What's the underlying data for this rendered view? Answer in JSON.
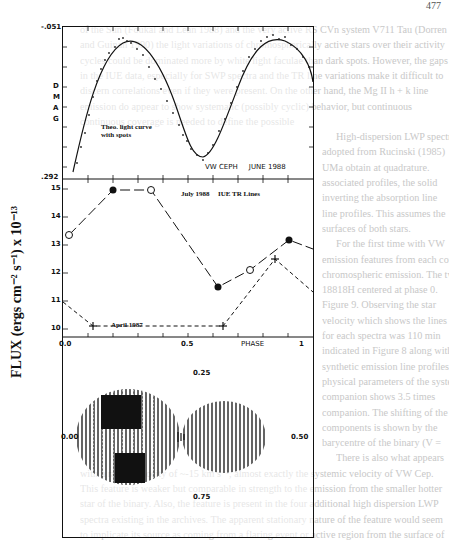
{
  "page": {
    "page_number": "477",
    "body_text_lines": [
      "of the Sun (Foukal and Lean 1988) and the very active RS CVn system V711 Tau (Dorren",
      "and Guinan 1990) the light variations of chromospherically active stars over their activity",
      "cycles could be dominated more by white light faculae than dark spots. However, the gaps",
      "in the IUE data, especially for SWP spectra and the TR line variations make it difficult to",
      "discern correlations even if they were present. On the other hand, the Mg II h + k line",
      "emission do appear to show systematic (possibly cyclic) behavior, but continuous",
      "continuous coverage is needed to define the possible",
      "High-dispersion LWP spectra",
      "adopted from Rucinski (1985)",
      "UMa obtain at quadrature.",
      "associated profiles, the solid",
      "inverting the absorption line",
      "line profiles. This assumes the",
      "surfaces of both stars.",
      "For the first time with VW",
      "emission features from each component",
      "chromospheric emission. The two highest",
      "18818H centered at phase 0.",
      "Figure 9. Observing the star",
      "velocity which shows the lines",
      "for each spectra was 110 min",
      "indicated in Figure 8 along with",
      "synthetic emission line profiles",
      "physical parameters of the system",
      "companion shows 3.5 times",
      "companion. The shifting of the",
      "components is shown by the",
      "barycentre of the binary (V =",
      "There is also what appears",
      "with a radial velocity of ~-15 km s⁻¹, almost exactly the systemic velocity of VW Cep.",
      "This feature is weaker but comparable in strength to the emission from the smaller hotter",
      "star of the binary. Also, the feature is present in the four additional high dispersion LWP",
      "spectra existing in the archives. The apparent stationary nature of the feature would seem",
      "to implicate its source as coming from a flaring event or active region from the surface of"
    ]
  },
  "figure": {
    "ylabel": "FLUX (ergs cm⁻² s⁻¹) x 10⁻¹³",
    "top_panel": {
      "y_top_label": "-.051",
      "y_bottom_label": ".292",
      "axis_label_vertical": [
        "D",
        "M",
        "A",
        "G"
      ],
      "curve_label_1": "Theo. light curve",
      "curve_label_2": "with spots",
      "annotation": "VW CEPH     JUNE 1988"
    },
    "middle_panel": {
      "title": "IUE TR Lines",
      "series_label_1": "July 1988",
      "series_label_2": "April 1987",
      "y_ticks": [
        "15",
        "14",
        "13",
        "12",
        "11",
        "10"
      ],
      "x_ticks": [
        "0.0",
        "0.5",
        "1"
      ],
      "x_label": "PHASE"
    },
    "bottom_panel": {
      "phase_labels": {
        "top": "0.25",
        "left": "0.00",
        "right": "0.50",
        "bottom": "0.75"
      }
    }
  },
  "chart_data": [
    {
      "type": "scatter",
      "title": "VW CEPH JUNE 1988",
      "xlabel": "PHASE",
      "ylabel": "DMAG",
      "ylim": [
        0.292,
        -0.051
      ],
      "xlim": [
        0.0,
        1.0
      ],
      "series": [
        {
          "name": "Theo. light curve with spots",
          "type": "line",
          "x": [
            0.0,
            0.05,
            0.1,
            0.15,
            0.2,
            0.25,
            0.3,
            0.35,
            0.4,
            0.45,
            0.5,
            0.55,
            0.6,
            0.65,
            0.7,
            0.75,
            0.8,
            0.85,
            0.9,
            0.95,
            1.0
          ],
          "values": [
            0.28,
            0.2,
            0.1,
            0.03,
            -0.02,
            -0.035,
            -0.02,
            0.03,
            0.1,
            0.18,
            0.215,
            0.18,
            0.1,
            0.03,
            -0.015,
            -0.03,
            -0.02,
            0.03,
            0.1,
            0.2,
            0.28
          ]
        }
      ]
    },
    {
      "type": "line",
      "title": "IUE TR Lines",
      "xlabel": "PHASE",
      "ylabel": "FLUX (ergs cm-2 s-1) x 10-13",
      "ylim": [
        9.7,
        15.3
      ],
      "xlim": [
        0.0,
        1.0
      ],
      "series": [
        {
          "name": "July 1988",
          "x": [
            0.0,
            0.2,
            0.35,
            0.62,
            0.75,
            0.91,
            1.0
          ],
          "values": [
            12.6,
            14.9,
            14.9,
            11.4,
            12.0,
            13.1,
            12.7
          ],
          "markers": [
            "open",
            "filled",
            "open",
            "filled",
            "open",
            "filled",
            null
          ]
        },
        {
          "name": "April 1987",
          "x": [
            0.0,
            0.12,
            0.62,
            0.82,
            1.0
          ],
          "values": [
            11.1,
            9.9,
            9.9,
            12.3,
            11.1
          ],
          "markers": [
            null,
            "plus",
            "plus",
            "plus",
            null
          ]
        }
      ]
    }
  ]
}
